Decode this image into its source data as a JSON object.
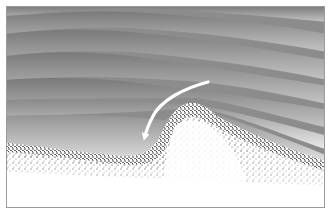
{
  "diagram": {
    "elements": [
      {
        "id": "air-layers",
        "description": "grey gradient streamline layers of air flowing over terrain"
      },
      {
        "id": "hill",
        "description": "stippled terrain profile with a rounded hill"
      },
      {
        "id": "flow-arrow",
        "description": "white curved arrow descending the windward/lee slope"
      }
    ],
    "colors": {
      "frame": "#8a8a8a",
      "air_dark": "#6e6e6e",
      "air_light": "#e6e6e6",
      "arrow": "#ffffff",
      "ground": "#ffffff",
      "stipple": "#1a1a1a"
    }
  }
}
